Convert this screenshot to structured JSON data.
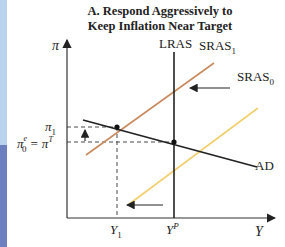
{
  "title": {
    "line1": "A. Respond Aggressively to",
    "line2": "Keep Inflation Near Target"
  },
  "axes": {
    "y_label": "π",
    "x_label": "Y"
  },
  "curves": {
    "lras": "LRAS",
    "sras1": "SRAS",
    "sras1_sub": "1",
    "sras0": "SRAS",
    "sras0_sub": "0",
    "ad": "AD"
  },
  "y_ticks": {
    "pi1": "π",
    "pi1_sub": "1",
    "pi0e": "π",
    "pi0e_sub": "0",
    "pi0e_sup": "e",
    "eq": " = π",
    "piT_sup": "T"
  },
  "x_ticks": {
    "y1": "Y",
    "y1_sub": "1",
    "yp": "Y",
    "yp_sup": "P"
  },
  "colors": {
    "sras1": "#c98a5e",
    "sras0": "#f2cf6e",
    "ad": "#222222",
    "strip_top": "#b9d3ee",
    "strip_bottom": "#6e7fbf"
  }
}
